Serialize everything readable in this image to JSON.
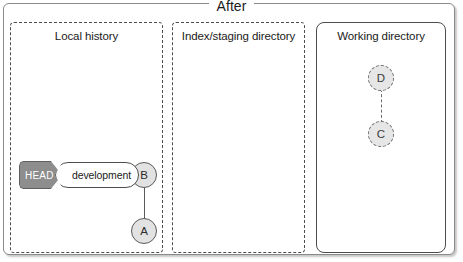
{
  "diagram": {
    "title": "After",
    "panels": [
      {
        "id": "local",
        "title": "Local history",
        "border": "dashed"
      },
      {
        "id": "index",
        "title": "Index/staging directory",
        "border": "dashed"
      },
      {
        "id": "working",
        "title": "Working directory",
        "border": "solid"
      }
    ],
    "nodes": [
      {
        "id": "b",
        "label": "B",
        "panel": "local",
        "style": "committed"
      },
      {
        "id": "a",
        "label": "A",
        "panel": "local",
        "style": "committed"
      },
      {
        "id": "d",
        "label": "D",
        "panel": "working",
        "style": "untracked"
      },
      {
        "id": "c",
        "label": "C",
        "panel": "working",
        "style": "untracked"
      }
    ],
    "edges": [
      {
        "from": "b",
        "to": "a",
        "style": "solid"
      },
      {
        "from": "d",
        "to": "c",
        "style": "dashed"
      }
    ],
    "refs": {
      "head_label": "HEAD",
      "branch_label": "development",
      "points_to": "B"
    },
    "colors": {
      "node_fill": "#e2e2e2",
      "node_stroke": "#5a5a5a",
      "head_fill": "#8d8d8d",
      "head_text": "#ffffff",
      "panel_stroke": "#4d4d4d",
      "frame_stroke": "#8a8a8a"
    }
  }
}
